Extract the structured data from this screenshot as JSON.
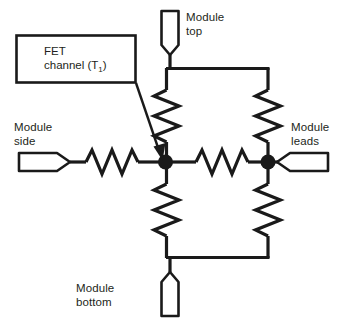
{
  "diagram": {
    "type": "thermal-resistance-network-schematic",
    "colors": {
      "line": "#1a1a1a",
      "text": "#231f20",
      "background": "#ffffff",
      "node_fill": "#1a1a1a",
      "terminal_fill": "#ffffff"
    },
    "callout": {
      "line_1": "FET",
      "line_2_prefix": "channel (T",
      "line_2_subscript": "1",
      "line_2_suffix": ")",
      "arrow_target": "center-node"
    },
    "terminals": [
      {
        "id": "module-top",
        "label_line_1": "Module",
        "label_line_2": "top",
        "orientation": "down"
      },
      {
        "id": "module-side",
        "label_line_1": "Module",
        "label_line_2": "side",
        "orientation": "right"
      },
      {
        "id": "module-leads",
        "label_line_1": "Module",
        "label_line_2": "leads",
        "orientation": "left"
      },
      {
        "id": "module-bottom",
        "label_line_1": "Module",
        "label_line_2": "bottom",
        "orientation": "down"
      }
    ],
    "resistors": [
      {
        "id": "resistor-side",
        "orientation": "horizontal",
        "between": [
          "module-side",
          "center-node"
        ]
      },
      {
        "id": "resistor-center-right",
        "orientation": "horizontal",
        "between": [
          "center-node",
          "right-node"
        ]
      },
      {
        "id": "resistor-top-left",
        "orientation": "vertical",
        "between": [
          "top-rail",
          "center-node"
        ]
      },
      {
        "id": "resistor-top-right",
        "orientation": "vertical",
        "between": [
          "top-rail",
          "right-node"
        ]
      },
      {
        "id": "resistor-bottom-left",
        "orientation": "vertical",
        "between": [
          "center-node",
          "bottom-rail"
        ]
      },
      {
        "id": "resistor-bottom-right",
        "orientation": "vertical",
        "between": [
          "right-node",
          "bottom-rail"
        ]
      }
    ],
    "nodes": [
      {
        "id": "center-node",
        "x": 165,
        "y": 162
      },
      {
        "id": "right-node",
        "x": 268,
        "y": 162
      }
    ]
  }
}
